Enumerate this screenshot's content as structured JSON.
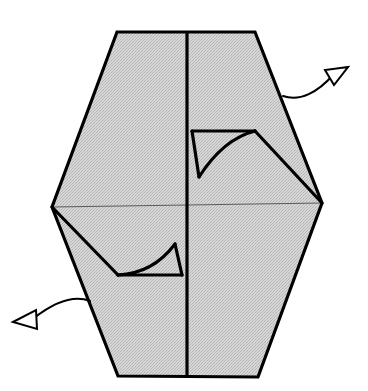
{
  "figure": {
    "canvas": {
      "width": 368,
      "height": 391
    },
    "colors": {
      "paper_fill": "#c8c8c8",
      "paper_fill_light": "#d2d2d2",
      "outline": "#000000",
      "crease_thin": "#555555",
      "background": "#ffffff"
    },
    "strokes": {
      "outline_width": 3.2,
      "fold_width": 3.2,
      "crease_thin_width": 1.0,
      "arrow_width": 2.0
    },
    "shapes": {
      "hexagon": {
        "name": "paper-hexagon",
        "points": "117,32 255,32 322,203 258,377 118,376 52,207"
      },
      "center_crease": {
        "name": "center-vertical-crease",
        "path": "M 187,32 L 187,377"
      },
      "horizontal_crease": {
        "name": "horizontal-crease",
        "path": "M 52,207 L 322,203"
      },
      "upper_pleat": {
        "name": "upper-right-pleat",
        "top_edge": "M 192,131 L 255,131",
        "spike": "M 192,131 L 199,177",
        "curve": "M 199,177 C 215,152 235,136 255,131",
        "diagonal": "M 255,131 L 322,203"
      },
      "lower_pleat": {
        "name": "lower-left-pleat",
        "bottom_edge": "M 118,275 L 182,275",
        "spike": "M 182,275 L 175,244",
        "curve": "M 175,244 C 160,264 140,274 118,275",
        "diagonal": "M 52,207 L 118,275"
      }
    },
    "arrows": [
      {
        "name": "arrow-upper-right",
        "label": "fold outward upper right",
        "direction": "up-right",
        "path": "M 283,96 C 300,102 318,92 333,75",
        "tip": {
          "x": 348,
          "y": 67
        },
        "head_points": "348,67 325,70 334,85"
      },
      {
        "name": "arrow-lower-left",
        "label": "fold outward lower left",
        "direction": "down-left",
        "path": "M 90,301 C 72,294 52,304 34,318",
        "tip": {
          "x": 13,
          "y": 322
        },
        "head_points": "13,322 36,310 37,329"
      }
    ]
  }
}
